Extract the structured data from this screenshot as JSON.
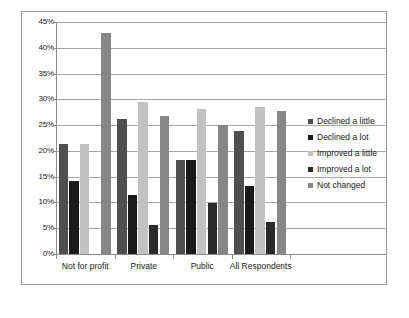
{
  "chart_data": {
    "type": "bar",
    "title": "",
    "subtitle": "",
    "xlabel": "",
    "ylabel": "",
    "categories": [
      "Not for profit",
      "Private",
      "Public",
      "All Respondents"
    ],
    "series": [
      {
        "name": "Declined a little",
        "color": "#4f4f4f",
        "values": [
          21.3,
          26.2,
          18.2,
          23.9
        ]
      },
      {
        "name": "Declined a lot",
        "color": "#1a1a1a",
        "values": [
          14.2,
          11.5,
          18.2,
          13.2
        ]
      },
      {
        "name": "Improved a little",
        "color": "#c2c2c2",
        "values": [
          21.3,
          29.4,
          28.2,
          28.5
        ]
      },
      {
        "name": "Improved a lot",
        "color": "#2b2b2b",
        "values": [
          0,
          5.6,
          9.9,
          6.3
        ]
      },
      {
        "name": "Not changed",
        "color": "#878787",
        "values": [
          42.8,
          26.8,
          25.0,
          27.7
        ]
      }
    ],
    "ylim": [
      0,
      45
    ],
    "ytick_step": 5,
    "ytick_labels": [
      "0%",
      "5%",
      "10%",
      "15%",
      "20%",
      "25%",
      "30%",
      "35%",
      "40%",
      "45%"
    ],
    "grid": true,
    "legend_position": "right",
    "value_suffix": "%"
  }
}
